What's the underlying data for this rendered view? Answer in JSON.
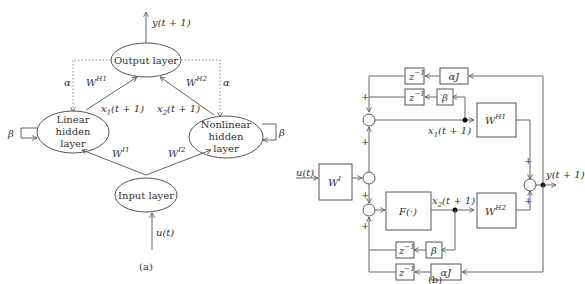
{
  "panel_a": {
    "caption": "(a)",
    "nodes": {
      "output": "Output layer",
      "linear": [
        "Linear",
        "hidden",
        "layer"
      ],
      "nonlinear": [
        "Nonlinear",
        "hidden",
        "layer"
      ],
      "input": "Input layer"
    },
    "labels": {
      "y_out": "y(t + 1)",
      "u_in": "u(t)",
      "alpha_left": "α",
      "alpha_right": "α",
      "beta_left": "β",
      "beta_right": "β",
      "W_H1": "W",
      "W_H1_sup": "H1",
      "W_H2": "W",
      "W_H2_sup": "H2",
      "W_I1": "W",
      "W_I1_sup": "I1",
      "W_I2": "W",
      "W_I2_sup": "I2",
      "x1": "x",
      "x1_sub": "1",
      "x1_arg": "(t + 1)",
      "x2": "x",
      "x2_sub": "2",
      "x2_arg": "(t + 1)"
    }
  },
  "panel_b": {
    "caption": "(b)",
    "blocks": {
      "WI": "W",
      "WI_sup": "I",
      "F": "F(·)",
      "WH1": "W",
      "WH1_sup": "H1",
      "WH2": "W",
      "WH2_sup": "H2",
      "z_inv": "z",
      "z_inv_sup": "−1",
      "alphaJ": "αJ",
      "beta": "β"
    },
    "labels": {
      "u_in": "u(t)",
      "y_out": "y(t + 1)",
      "x1": "x",
      "x1_sub": "1",
      "x1_arg": "(t + 1)",
      "x2": "x",
      "x2_sub": "2",
      "x2_arg": "(t + 1)",
      "plus": "+"
    }
  }
}
